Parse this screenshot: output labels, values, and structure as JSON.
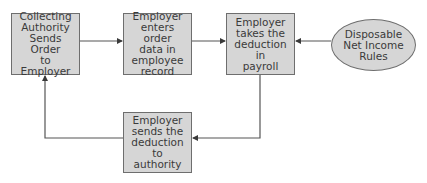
{
  "diagram": {
    "nodes": [
      {
        "id": "n1",
        "shape": "rect",
        "label": "Collecting\nAuthority\nSends Order\nto Employer"
      },
      {
        "id": "n2",
        "shape": "rect",
        "label": "Employer\nenters order\ndata in\nemployee\nrecord"
      },
      {
        "id": "n3",
        "shape": "rect",
        "label": "Employer\ntakes the\ndeduction in\npayroll"
      },
      {
        "id": "n4",
        "shape": "ellipse",
        "label": "Disposable\nNet Income\nRules"
      },
      {
        "id": "n5",
        "shape": "rect",
        "label": "Employer\nsends the\ndeduction to\nauthority"
      }
    ],
    "edges": [
      {
        "from": "n1",
        "to": "n2"
      },
      {
        "from": "n2",
        "to": "n3"
      },
      {
        "from": "n4",
        "to": "n3"
      },
      {
        "from": "n3",
        "to": "n5"
      },
      {
        "from": "n5",
        "to": "n1"
      }
    ],
    "colors": {
      "fill": "#d6d6d6",
      "stroke": "#6e6e6e",
      "text": "#3a3a3a",
      "line": "#555555"
    }
  }
}
